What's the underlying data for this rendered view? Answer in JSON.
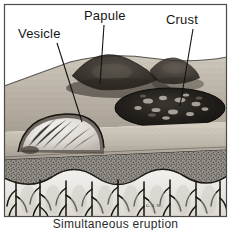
{
  "figure": {
    "type": "medical-illustration",
    "style": "grayscale pen-and-ink / airbrush anatomical block diagram",
    "caption": "Simultaneous eruption",
    "signature": "G.J.W."
  },
  "labels": [
    {
      "id": "vesicle",
      "text": "Vesicle"
    },
    {
      "id": "papule",
      "text": "Papule"
    },
    {
      "id": "crust",
      "text": "Crust"
    }
  ],
  "leaders": [
    {
      "id": "vesicle-leader",
      "from_label": "Vesicle",
      "to_structure": "vesicle-dome"
    },
    {
      "id": "papule-leader",
      "from_label": "Papule",
      "to_structure": "papule-mound"
    },
    {
      "id": "crust-leader",
      "from_label": "Crust",
      "to_structure": "crust-lesion"
    }
  ],
  "structures": [
    {
      "id": "skin-surface",
      "name": "Skin surface (epidermis top)"
    },
    {
      "id": "vesicle-dome",
      "name": "Vesicle — fluid-filled blister"
    },
    {
      "id": "papule-mound",
      "name": "Papule — raised solid elevation"
    },
    {
      "id": "crust-lesion",
      "name": "Crust — dried exudate"
    },
    {
      "id": "dermis-stipple",
      "name": "Dermis (stippled connective tissue)"
    },
    {
      "id": "papillae-layer",
      "name": "Dermal papillae with vascular plexus"
    }
  ],
  "colors": {
    "page_background": "#ffffff",
    "ink": "#1b1b1b",
    "epidermis_light": "#d9d4cb",
    "epidermis_mid": "#b3aca2",
    "dermis_stipple": "#8d8d8d",
    "lesion_dark": "#1e1c1a",
    "vesicle_fluid": "#e8e6e2",
    "frame": "#4a4a4a"
  }
}
